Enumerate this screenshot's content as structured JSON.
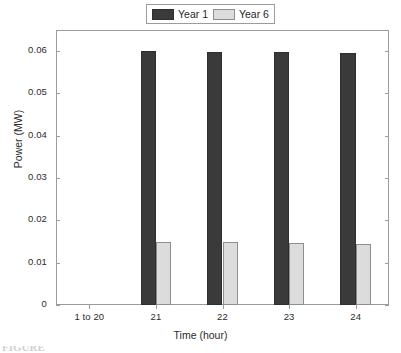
{
  "chart_data": {
    "type": "bar",
    "title": "",
    "xlabel": "Time (hour)",
    "ylabel": "Power (MW)",
    "categories": [
      "1 to 20",
      "21",
      "22",
      "23",
      "24"
    ],
    "series": [
      {
        "name": "Year 1",
        "color": "#3a3a3a",
        "values": [
          0,
          0.06,
          0.0599,
          0.0598,
          0.0596
        ]
      },
      {
        "name": "Year 6",
        "color": "#dcdcdc",
        "values": [
          0,
          0.0149,
          0.0148,
          0.0146,
          0.0145
        ]
      }
    ],
    "ylim": [
      0,
      0.065
    ],
    "yticks": [
      0,
      0.01,
      0.02,
      0.03,
      0.04,
      0.05,
      0.06
    ],
    "ytick_labels": [
      "0",
      "0.01",
      "0.02",
      "0.03",
      "0.04",
      "0.05",
      "0.06"
    ],
    "grid": false,
    "legend_position": "top-center"
  },
  "legend": {
    "entries": [
      {
        "label": "Year 1"
      },
      {
        "label": "Year 6"
      }
    ]
  },
  "caption": {
    "text": "FIGURE"
  }
}
